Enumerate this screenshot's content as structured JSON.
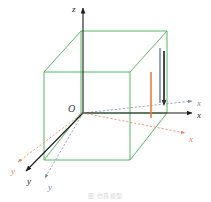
{
  "figure": {
    "title_caption": "图     仿真模型",
    "origin_label": "O",
    "background_color": "#ffffff"
  },
  "colors": {
    "box_green": "#44b050",
    "axis_black": "#1a1a1a",
    "axis_orange": "#f08050",
    "axis_blue_gray": "#7a8bb0",
    "bar_orange": "#ef7a3d",
    "bar_blue_gray": "#8d9ab8",
    "bar_dark": "#333333",
    "caption_gray": "#d8d8d8"
  },
  "axes": [
    {
      "name": "z-axis",
      "label": "z",
      "color": "#1a1a1a",
      "style": "solid",
      "direction": "up"
    },
    {
      "name": "x-axis-black",
      "label": "x",
      "color": "#1a1a1a",
      "style": "solid",
      "direction": "right"
    },
    {
      "name": "x-axis-blue",
      "label": "x",
      "color": "#7a8bb0",
      "style": "dashed",
      "direction": "right-upper"
    },
    {
      "name": "x-axis-orange",
      "label": "x",
      "color": "#f08050",
      "style": "dashed",
      "direction": "right-lower"
    },
    {
      "name": "y-axis-black",
      "label": "y",
      "color": "#1a1a1a",
      "style": "solid",
      "direction": "lower-left"
    },
    {
      "name": "y-axis-blue",
      "label": "y",
      "color": "#7a8bb0",
      "style": "dashed",
      "direction": "lower-left-steep"
    },
    {
      "name": "y-axis-orange",
      "label": "y",
      "color": "#f08050",
      "style": "dashed",
      "direction": "far-left"
    }
  ],
  "bars": [
    {
      "name": "bar-orange",
      "color": "#ef7a3d",
      "top_y": 72,
      "bottom_y": 118,
      "x": 151
    },
    {
      "name": "bar-blue-gray",
      "color": "#8d9ab8",
      "top_y": 48,
      "bottom_y": 103,
      "x": 160
    },
    {
      "name": "bar-dark",
      "color": "#333333",
      "top_y": 51,
      "bottom_y": 104,
      "x": 164
    }
  ],
  "box": {
    "name": "wireframe-cube",
    "color": "#44b050",
    "front_bottom_left": [
      44,
      160
    ],
    "front_top_left": [
      44,
      72
    ],
    "front_bottom_right": [
      130,
      160
    ],
    "front_top_right": [
      130,
      72
    ],
    "back_bottom_left": [
      81,
      113
    ],
    "back_top_left": [
      81,
      31
    ],
    "back_bottom_right": [
      167,
      113
    ],
    "back_top_right": [
      167,
      31
    ]
  }
}
